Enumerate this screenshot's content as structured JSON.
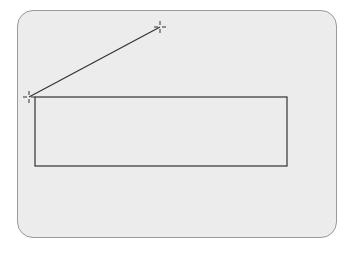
{
  "canvas": {
    "background": "#ececec",
    "stroke_color": "#333333"
  },
  "shapes": {
    "rectangle": {
      "x": 35,
      "y": 97,
      "width": 252,
      "height": 69
    },
    "line": {
      "x1": 29,
      "y1": 97,
      "x2": 160,
      "y2": 27
    },
    "handles": [
      {
        "x": 29,
        "y": 97
      },
      {
        "x": 160,
        "y": 27
      }
    ]
  }
}
